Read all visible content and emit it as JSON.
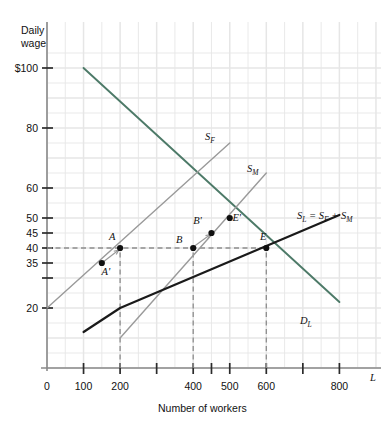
{
  "chart_data": {
    "type": "line",
    "title": "",
    "xlabel": "Number of workers",
    "ylabel": "Daily wage",
    "x_axis_symbol": "L",
    "xlim": [
      0,
      900
    ],
    "ylim": [
      0,
      105
    ],
    "grid": true,
    "legend": "inline-curve-labels",
    "xticks": [
      {
        "value": 0,
        "label": "0",
        "major": true
      },
      {
        "value": 100,
        "label": "100",
        "major": true
      },
      {
        "value": 200,
        "label": "200",
        "major": true
      },
      {
        "value": 300,
        "label": "",
        "major": true
      },
      {
        "value": 400,
        "label": "400",
        "major": true
      },
      {
        "value": 450,
        "label": "",
        "major": true
      },
      {
        "value": 500,
        "label": "500",
        "major": true
      },
      {
        "value": 600,
        "label": "600",
        "major": true
      },
      {
        "value": 700,
        "label": "",
        "major": true
      },
      {
        "value": 800,
        "label": "800",
        "major": true
      }
    ],
    "yticks": [
      {
        "value": 100,
        "label": "$100"
      },
      {
        "value": 80,
        "label": "80"
      },
      {
        "value": 60,
        "label": "60"
      },
      {
        "value": 50,
        "label": "50"
      },
      {
        "value": 45,
        "label": "45"
      },
      {
        "value": 40,
        "label": "40"
      },
      {
        "value": 35,
        "label": "35"
      },
      {
        "value": 30,
        "label": ""
      },
      {
        "value": 20,
        "label": "20"
      }
    ],
    "series": [
      {
        "name": "D_L",
        "label": "D",
        "label_sub": "L",
        "role": "labor-demand",
        "color": "#4d7a68",
        "style": "solid",
        "points": [
          [
            100,
            100
          ],
          [
            800,
            22
          ]
        ]
      },
      {
        "name": "S_F",
        "label": "S",
        "label_sub": "F",
        "role": "female-labor-supply",
        "color": "#9a9a9a",
        "style": "solid",
        "points": [
          [
            0,
            20
          ],
          [
            500,
            75
          ]
        ]
      },
      {
        "name": "S_M",
        "label": "S",
        "label_sub": "M",
        "role": "male-labor-supply",
        "color": "#9a9a9a",
        "style": "solid",
        "points": [
          [
            200,
            10
          ],
          [
            600,
            65
          ]
        ]
      },
      {
        "name": "S_L",
        "label": "S",
        "label_sub": "L",
        "label_suffix": " = S",
        "label_suffix_sub": "F",
        "label_suffix2": " + S",
        "label_suffix2_sub": "M",
        "role": "total-labor-supply",
        "color": "#1a1a1a",
        "style": "solid",
        "points": [
          [
            100,
            12
          ],
          [
            200,
            20
          ],
          [
            800,
            51
          ]
        ]
      }
    ],
    "points": [
      {
        "name": "A",
        "label": "A",
        "x": 200,
        "y": 40,
        "label_dx": -8,
        "label_dy": -8
      },
      {
        "name": "A'",
        "label": "A'",
        "x": 150,
        "y": 35,
        "label_dx": 4,
        "label_dy": 12
      },
      {
        "name": "B",
        "label": "B",
        "x": 400,
        "y": 40,
        "label_dx": -14,
        "label_dy": -5
      },
      {
        "name": "B'",
        "label": "B'",
        "x": 450,
        "y": 45,
        "label_dx": -14,
        "label_dy": -9
      },
      {
        "name": "E",
        "label": "E",
        "x": 600,
        "y": 40,
        "label_dx": -3,
        "label_dy": -8
      },
      {
        "name": "E'",
        "label": "E'",
        "x": 500,
        "y": 50,
        "label_dx": 7,
        "label_dy": 3
      }
    ],
    "arrows": [
      {
        "name": "arrow-A-prime-to-A",
        "from": [
          150,
          35
        ],
        "to": [
          196,
          39.3
        ]
      },
      {
        "name": "arrow-B-to-B-prime",
        "from": [
          402,
          40.5
        ],
        "to": [
          447,
          44.5
        ]
      }
    ],
    "dashed_guides": [
      {
        "name": "wage-40-horizontal",
        "orientation": "horizontal",
        "value": 40,
        "from": 0,
        "to": 600
      },
      {
        "name": "workers-200-vertical",
        "orientation": "vertical",
        "value": 200,
        "from": 0,
        "to": 40
      },
      {
        "name": "workers-400-vertical",
        "orientation": "vertical",
        "value": 400,
        "from": 0,
        "to": 40
      },
      {
        "name": "workers-600-vertical",
        "orientation": "vertical",
        "value": 600,
        "from": 0,
        "to": 40
      }
    ]
  },
  "figure": {
    "caption": ""
  }
}
